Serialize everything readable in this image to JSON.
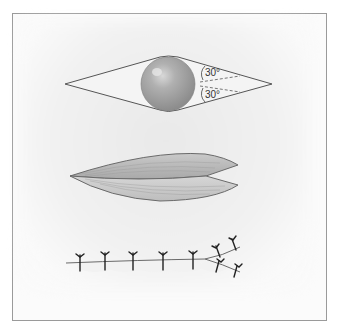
{
  "figure": {
    "panels": [
      {
        "name": "elliptical-excision-with-lesion",
        "angle_labels": [
          "30°",
          "30°"
        ]
      },
      {
        "name": "undermined-wound-edges"
      },
      {
        "name": "sutured-closure-with-dog-ear-repair",
        "suture_count": 9
      }
    ],
    "colors": {
      "outline": "#555555",
      "lesion": "#a8a8a8",
      "tissue": "#b5b5b5",
      "suture": "#222222",
      "frame": "#9a9a9a"
    }
  }
}
